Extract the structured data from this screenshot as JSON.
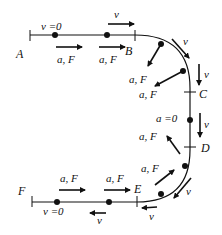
{
  "diagram": {
    "points": {
      "A": "A",
      "B": "B",
      "C": "C",
      "D": "D",
      "E": "E",
      "F": "F"
    },
    "labels": {
      "v_zero_top": "v =0",
      "v_zero_bottom": "v =0",
      "a_zero": "a =0",
      "v": "v",
      "aF": "a, F",
      "F_partial": "F"
    },
    "colors": {
      "stroke": "#111111",
      "background": "#ffffff"
    }
  }
}
